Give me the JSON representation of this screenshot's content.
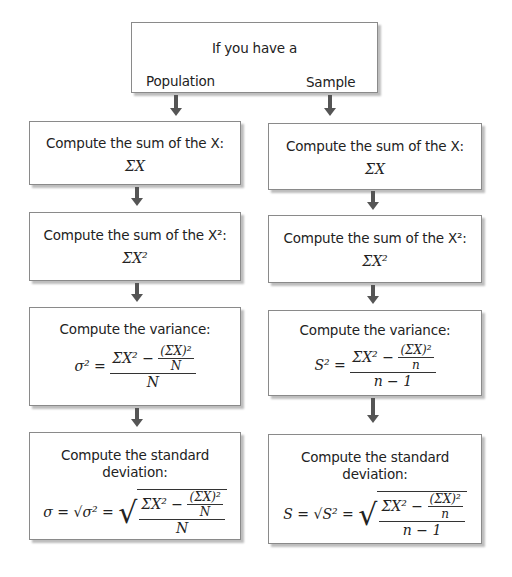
{
  "top": {
    "title": "If you have a",
    "left_label": "Population",
    "right_label": "Sample"
  },
  "population": {
    "step1": {
      "label": "Compute the sum of the X:",
      "formula": "ΣX"
    },
    "step2": {
      "label": "Compute the sum of the X²:",
      "formula": "ΣX²"
    },
    "step3": {
      "label": "Compute the variance:",
      "lhs": "σ² =",
      "num_a": "ΣX² −",
      "inner_num": "(ΣX)²",
      "inner_den": "N",
      "den": "N"
    },
    "step4": {
      "label": "Compute the standard deviation:",
      "lhs": "σ = √σ² =",
      "num_a": "ΣX² −",
      "inner_num": "(ΣX)²",
      "inner_den": "N",
      "den": "N"
    }
  },
  "sample": {
    "step1": {
      "label": "Compute the sum of the X:",
      "formula": "ΣX"
    },
    "step2": {
      "label": "Compute the sum of the X²:",
      "formula": "ΣX²"
    },
    "step3": {
      "label": "Compute the variance:",
      "lhs": "S² =",
      "num_a": "ΣX² −",
      "inner_num": "(ΣX)²",
      "inner_den": "n",
      "den": "n − 1"
    },
    "step4": {
      "label": "Compute the standard deviation:",
      "lhs": "S = √S² =",
      "num_a": "ΣX² −",
      "inner_num": "(ΣX)²",
      "inner_den": "n",
      "den": "n − 1"
    }
  }
}
